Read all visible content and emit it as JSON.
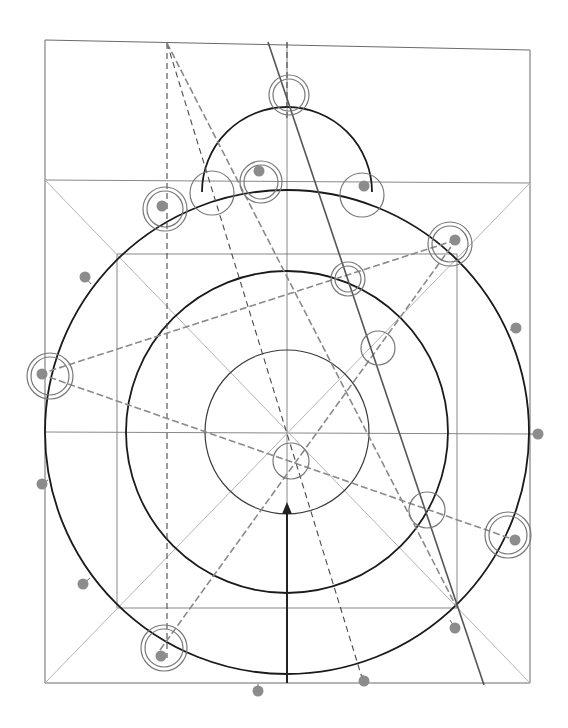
{
  "diagram": {
    "type": "geometric-construction",
    "width": 568,
    "height": 728,
    "center": {
      "x": 287,
      "y": 432
    },
    "frame": {
      "outer_rect": {
        "points": [
          [
            45,
            40
          ],
          [
            530,
            50
          ],
          [
            530,
            683
          ],
          [
            45,
            683
          ]
        ]
      },
      "upper_band_line": {
        "x1": 45,
        "y1": 180,
        "x2": 530,
        "y2": 183
      },
      "inner_square": {
        "x": 117,
        "y": 254,
        "w": 340,
        "h": 354
      },
      "horizontal_axis": {
        "x1": 45,
        "y1": 432,
        "x2": 530,
        "y2": 434
      },
      "vertical_axis": {
        "x1": 287,
        "y1": 42,
        "x2": 287,
        "y2": 683
      }
    },
    "diagonals": [
      {
        "x1": 45,
        "y1": 180,
        "x2": 530,
        "y2": 683
      },
      {
        "x1": 530,
        "y1": 183,
        "x2": 45,
        "y2": 683
      }
    ],
    "circles": [
      {
        "name": "outer-circle",
        "cx": 287,
        "cy": 432,
        "r": 242,
        "style": "heavy"
      },
      {
        "name": "middle-circle",
        "cx": 287,
        "cy": 432,
        "r": 161,
        "style": "heavy"
      },
      {
        "name": "inner-circle",
        "cx": 287,
        "cy": 432,
        "r": 82,
        "style": "medium"
      }
    ],
    "top_arc": {
      "cx": 287,
      "cy": 192,
      "r": 85,
      "start_deg": 180,
      "end_deg": 360
    },
    "solid_ray": {
      "x1": 268,
      "y1": 42,
      "x2": 484,
      "y2": 685
    },
    "dashed_lines_dark": [
      {
        "x1": 167,
        "y1": 43,
        "x2": 167,
        "y2": 658
      },
      {
        "x1": 167,
        "y1": 43,
        "x2": 363,
        "y2": 681
      },
      {
        "x1": 287,
        "y1": 42,
        "x2": 287,
        "y2": 120
      }
    ],
    "dashed_lines_grey": [
      {
        "x1": 167,
        "y1": 43,
        "x2": 457,
        "y2": 608
      },
      {
        "x1": 40,
        "y1": 374,
        "x2": 456,
        "y2": 240
      },
      {
        "x1": 40,
        "y1": 374,
        "x2": 515,
        "y2": 540
      },
      {
        "x1": 160,
        "y1": 650,
        "x2": 456,
        "y2": 240
      }
    ],
    "arrow": {
      "x": 287,
      "y_start": 683,
      "y_end": 502,
      "head_size": 8
    },
    "rings": [
      {
        "name": "ring-top",
        "cx": 289,
        "cy": 95,
        "r": [
          20,
          16
        ],
        "dot": null
      },
      {
        "name": "ring-upper-left",
        "cx": 165,
        "cy": 209,
        "r": [
          22,
          18
        ],
        "dot": [
          162,
          206
        ]
      },
      {
        "name": "ring-top-left-single",
        "cx": 212,
        "cy": 193,
        "r": [
          22
        ],
        "dot": null
      },
      {
        "name": "ring-top-center",
        "cx": 261,
        "cy": 182,
        "r": [
          21,
          17
        ],
        "dot": [
          259,
          171
        ]
      },
      {
        "name": "ring-top-right-single",
        "cx": 362,
        "cy": 195,
        "r": [
          22
        ],
        "dot": [
          364,
          186
        ]
      },
      {
        "name": "ring-right-upper",
        "cx": 450,
        "cy": 244,
        "r": [
          22,
          18
        ],
        "dot": [
          455,
          240
        ]
      },
      {
        "name": "ring-mid-right",
        "cx": 348,
        "cy": 279,
        "r": [
          17,
          13
        ],
        "dot": null
      },
      {
        "name": "ring-center-right",
        "cx": 378,
        "cy": 348,
        "r": [
          17
        ],
        "dot": null
      },
      {
        "name": "ring-left",
        "cx": 50,
        "cy": 376,
        "r": [
          23,
          19
        ],
        "dot": [
          42,
          374
        ]
      },
      {
        "name": "ring-center",
        "cx": 291,
        "cy": 461,
        "r": [
          18
        ],
        "dot": null
      },
      {
        "name": "ring-lower-right-single",
        "cx": 427,
        "cy": 510,
        "r": [
          18
        ],
        "dot": null
      },
      {
        "name": "ring-right-lower",
        "cx": 508,
        "cy": 535,
        "r": [
          23,
          19
        ],
        "dot": [
          515,
          540
        ]
      },
      {
        "name": "ring-lower-left",
        "cx": 164,
        "cy": 648,
        "r": [
          23,
          19
        ],
        "dot": [
          161,
          656
        ]
      }
    ],
    "dots": [
      {
        "name": "dot-left-upper",
        "cx": 85,
        "cy": 277,
        "tick": [
          91,
          284
        ]
      },
      {
        "name": "dot-right-upper",
        "cx": 516,
        "cy": 328,
        "tick": [
          510,
          330
        ]
      },
      {
        "name": "dot-right-mid",
        "cx": 538,
        "cy": 434,
        "tick": [
          530,
          434
        ]
      },
      {
        "name": "dot-left-mid",
        "cx": 42,
        "cy": 484,
        "tick": [
          48,
          480
        ]
      },
      {
        "name": "dot-left-lower",
        "cx": 83,
        "cy": 584,
        "tick": [
          90,
          578
        ]
      },
      {
        "name": "dot-right-lower",
        "cx": 455,
        "cy": 628,
        "tick": [
          450,
          620
        ]
      },
      {
        "name": "dot-bottom-right",
        "cx": 364,
        "cy": 681,
        "tick": [
          363,
          675
        ]
      },
      {
        "name": "dot-bottom-left",
        "cx": 258,
        "cy": 691,
        "tick": [
          258,
          684
        ]
      }
    ],
    "colors": {
      "background": "#ffffff",
      "heavy_stroke": "#1a1a1a",
      "frame_stroke": "#6a6a6a",
      "construction_light": "#b4b4b4",
      "dot_fill": "#8c8c8c",
      "ring_stroke": "#777777"
    }
  }
}
